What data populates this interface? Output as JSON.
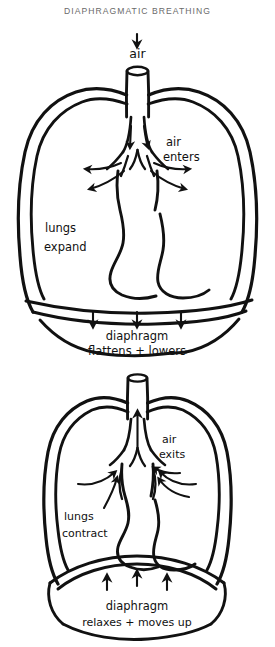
{
  "page": {
    "title": "DIAPHRAGMATIC BREATHING",
    "background_color": "#ffffff",
    "ink_color": "#111111",
    "title_color": "#6a6a6a",
    "width": 275,
    "height": 647
  },
  "diagrams": [
    {
      "id": "inhalation",
      "phase": "inhale",
      "labels": {
        "air": "air",
        "air_enters": "air\nenters",
        "air_enters_line1": "air",
        "air_enters_line2": "enters",
        "lungs_line1": "lungs",
        "lungs_line2": "expand",
        "diaphragm_line1": "diaphragm",
        "diaphragm_line2": "flattens + lowers"
      },
      "arrows": {
        "trachea_direction": "down",
        "bronchi_count": 4,
        "bronchi_direction": "outward",
        "diaphragm_arrow_count": 3,
        "diaphragm_arrow_direction": "down"
      }
    },
    {
      "id": "exhalation",
      "phase": "exhale",
      "labels": {
        "air_exits_line1": "air",
        "air_exits_line2": "exits",
        "lungs_line1": "lungs",
        "lungs_line2": "contract",
        "diaphragm_line1": "diaphragm",
        "diaphragm_line2": "relaxes + moves up"
      },
      "arrows": {
        "trachea_direction": "up",
        "bronchi_count": 2,
        "bronchi_direction": "inward",
        "diaphragm_arrow_count": 3,
        "diaphragm_arrow_direction": "up"
      }
    }
  ]
}
